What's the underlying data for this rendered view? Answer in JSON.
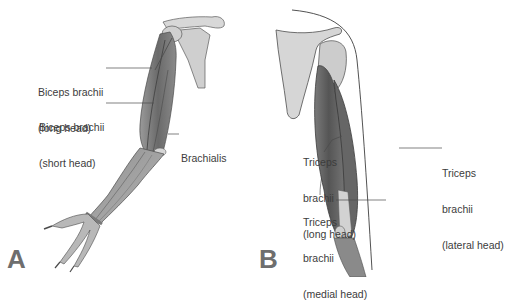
{
  "figure": {
    "panels": [
      {
        "letter": "A",
        "view": "anterior arm",
        "labels": [
          {
            "lines": [
              "Biceps brachii",
              "(long head)"
            ]
          },
          {
            "lines": [
              "Biceps brachii",
              "(short head)"
            ]
          },
          {
            "lines": [
              "Brachialis"
            ]
          }
        ]
      },
      {
        "letter": "B",
        "view": "posterior arm",
        "labels": [
          {
            "lines": [
              "Triceps",
              "brachii",
              "(long head)"
            ]
          },
          {
            "lines": [
              "Triceps",
              "brachii",
              "(lateral head)"
            ]
          },
          {
            "lines": [
              "Triceps",
              "brachii",
              "(medial head)"
            ]
          }
        ]
      }
    ],
    "colors": {
      "background": "#ffffff",
      "muscle_dark": "#5e5e5e",
      "muscle_mid": "#8c8c8c",
      "bone": "#d4d4d4",
      "outline": "#4a4a4a",
      "label_text": "#3c3c3c",
      "letter": "#6e6e6e"
    }
  }
}
